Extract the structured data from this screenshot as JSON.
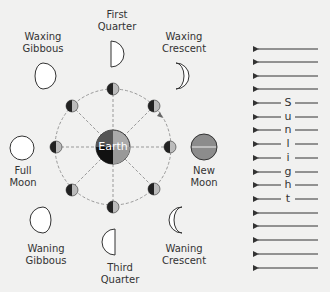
{
  "center": {
    "label": "Earth"
  },
  "phases": [
    {
      "id": "first-quarter",
      "line1": "First",
      "line2": "Quarter"
    },
    {
      "id": "waxing-gibbous",
      "line1": "Waxing",
      "line2": "Gibbous"
    },
    {
      "id": "waxing-crescent",
      "line1": "Waxing",
      "line2": "Crescent"
    },
    {
      "id": "full-moon",
      "line1": "Full",
      "line2": "Moon"
    },
    {
      "id": "new-moon",
      "line1": "New",
      "line2": "Moon"
    },
    {
      "id": "waning-gibbous",
      "line1": "Waning",
      "line2": "Gibbous"
    },
    {
      "id": "waning-crescent",
      "line1": "Waning",
      "line2": "Crescent"
    },
    {
      "id": "third-quarter",
      "line1": "Third",
      "line2": "Quarter"
    }
  ],
  "sunlight": {
    "letters": [
      "S",
      "u",
      "n",
      "l",
      "i",
      "g",
      "h",
      "t"
    ],
    "arrow_count": 17
  },
  "colors": {
    "stroke": "#333333",
    "dark": "#1a1a1a",
    "light": "#aaaaaa",
    "new_moon": "#8c8c8c",
    "background": "#f1f1f0"
  }
}
